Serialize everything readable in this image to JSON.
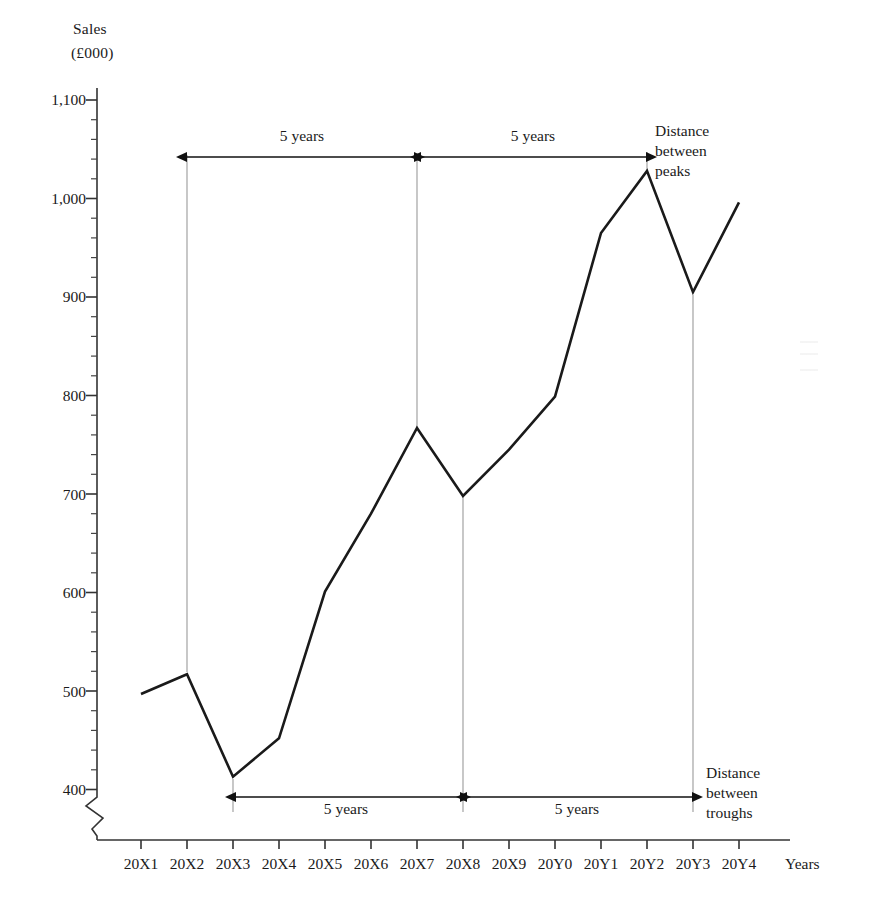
{
  "chart_data": {
    "type": "line",
    "title": "",
    "ylabel_line1": "Sales",
    "ylabel_line2": "(£000)",
    "xlabel": "Years",
    "categories": [
      "20X1",
      "20X2",
      "20X3",
      "20X4",
      "20X5",
      "20X6",
      "20X7",
      "20X8",
      "20X9",
      "20Y0",
      "20Y1",
      "20Y2",
      "20Y3",
      "20Y4"
    ],
    "values": [
      497,
      517,
      413,
      452,
      601,
      680,
      767,
      698,
      745,
      799,
      965,
      1028,
      905,
      996
    ],
    "ylim": [
      400,
      1100
    ],
    "y_major_ticks": [
      400,
      500,
      600,
      700,
      800,
      900,
      1000,
      1100
    ],
    "y_tick_labels": [
      "400",
      "500",
      "600",
      "700",
      "800",
      "900",
      "1,000",
      "1,100"
    ],
    "y_minor_tick_step": 20,
    "axis_break": true,
    "grid": false,
    "legend": "none",
    "annotations": [
      {
        "name": "top-span-1",
        "label": "5 years",
        "from": "20X2",
        "to": "20X7",
        "position": "above-label"
      },
      {
        "name": "top-span-2",
        "label": "5 years",
        "from": "20X7",
        "to": "20Y2",
        "position": "above-label"
      },
      {
        "name": "top-note",
        "label": "Distance between peaks",
        "lines": [
          "Distance",
          "between",
          "peaks"
        ]
      },
      {
        "name": "bottom-span-1",
        "label": "5 years",
        "from": "20X3",
        "to": "20X8",
        "position": "below-label"
      },
      {
        "name": "bottom-span-2",
        "label": "5 years",
        "from": "20X8",
        "to": "20Y3",
        "position": "below-label"
      },
      {
        "name": "bottom-note",
        "label": "Distance between troughs",
        "lines": [
          "Distance",
          "between",
          "troughs"
        ]
      }
    ],
    "peaks": [
      "20X2",
      "20X7",
      "20Y2"
    ],
    "troughs": [
      "20X3",
      "20X8",
      "20Y3"
    ],
    "line_color": "#1a1a1a",
    "axis_color": "#333333",
    "dropline_color": "#8a8a8a"
  },
  "axis": {
    "y_title_line1": "Sales",
    "y_title_line2": "(£000)",
    "x_title": "Years",
    "y_labels": [
      "1,100",
      "1,000",
      "900",
      "800",
      "700",
      "600",
      "500",
      "400"
    ],
    "x_labels": [
      "20X1",
      "20X2",
      "20X3",
      "20X4",
      "20X5",
      "20X6",
      "20X7",
      "20X8",
      "20X9",
      "20Y0",
      "20Y1",
      "20Y2",
      "20Y3",
      "20Y4"
    ]
  },
  "annotations": {
    "top_span_1": "5 years",
    "top_span_2": "5 years",
    "bottom_span_1": "5 years",
    "bottom_span_2": "5 years",
    "peaks_note_l1": "Distance",
    "peaks_note_l2": "between",
    "peaks_note_l3": "peaks",
    "troughs_note_l1": "Distance",
    "troughs_note_l2": "between",
    "troughs_note_l3": "troughs"
  }
}
